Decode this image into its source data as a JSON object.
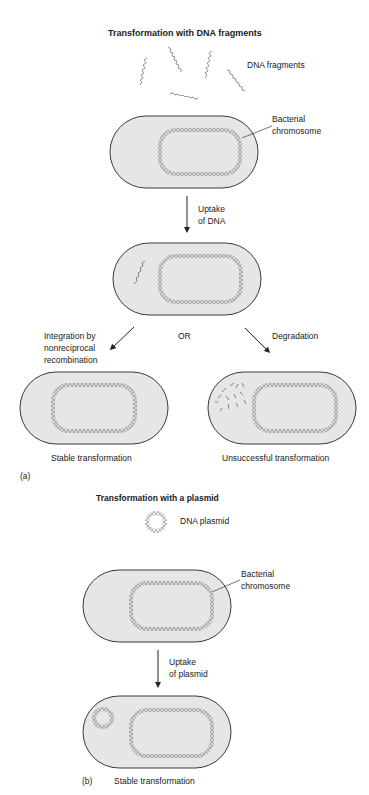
{
  "panel_a": {
    "title": "Transformation with DNA fragments",
    "label": "(a)",
    "dna_fragments_label": "DNA fragments",
    "chromosome_label": "Bacterial\nchromosome",
    "uptake_label": "Uptake\nof DNA",
    "integration_label": "Integration by\nnonreciprocal\nrecombination",
    "or_label": "OR",
    "degradation_label": "Degradation",
    "outcome_left": "Stable transformation",
    "outcome_right": "Unsuccessful transformation"
  },
  "panel_b": {
    "title": "Transformation with a plasmid",
    "label": "(b)",
    "plasmid_label": "DNA plasmid",
    "chromosome_label": "Bacterial\nchromosome",
    "uptake_label": "Uptake\nof plasmid",
    "outcome": "Stable transformation"
  },
  "colors": {
    "cell_fill": "#e6e6e6",
    "outline": "#3a3a3a",
    "dna": "#6a6a6a"
  }
}
